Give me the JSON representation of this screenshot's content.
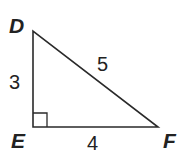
{
  "diagram": {
    "type": "right-triangle",
    "vertices": {
      "top": "D",
      "right_angle": "E",
      "right": "F"
    },
    "sides": {
      "DE": "3",
      "EF": "4",
      "DF": "5"
    },
    "right_angle_at": "E",
    "stroke_color": "#2a2a2a",
    "text_color": "#222222"
  }
}
